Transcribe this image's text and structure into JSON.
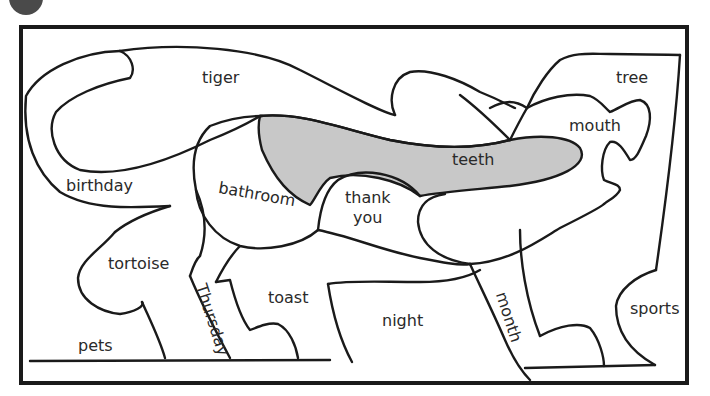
{
  "colors": {
    "outline": "#1a1a1a",
    "highlight_fill": "#c8c8c8",
    "badge": "#4a4a4a",
    "background": "#ffffff"
  },
  "puzzle": {
    "title": "",
    "highlighted_piece": "teeth",
    "pieces": [
      {
        "id": "tiger",
        "label": "tiger"
      },
      {
        "id": "tree",
        "label": "tree"
      },
      {
        "id": "mouth",
        "label": "mouth"
      },
      {
        "id": "teeth",
        "label": "teeth"
      },
      {
        "id": "birthday",
        "label": "birthday"
      },
      {
        "id": "bathroom",
        "label": "bathroom"
      },
      {
        "id": "thankyou",
        "label_line1": "thank",
        "label_line2": "you"
      },
      {
        "id": "tortoise",
        "label": "tortoise"
      },
      {
        "id": "thursday",
        "label": "Thursday"
      },
      {
        "id": "toast",
        "label": "toast"
      },
      {
        "id": "night",
        "label": "night"
      },
      {
        "id": "month",
        "label": "month"
      },
      {
        "id": "sports",
        "label": "sports"
      },
      {
        "id": "pets",
        "label": "pets"
      }
    ]
  }
}
